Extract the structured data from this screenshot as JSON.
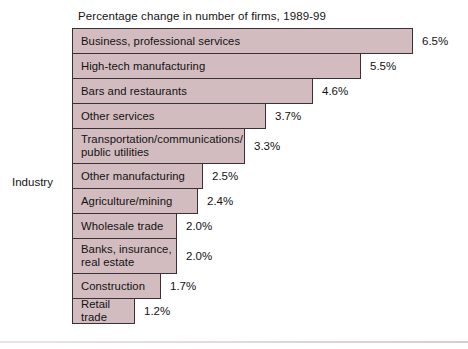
{
  "chart_data": {
    "type": "bar",
    "orientation": "horizontal",
    "title": "Percentage change in number of firms, 1989-99",
    "xlabel": "",
    "ylabel": "Industry",
    "grid": false,
    "legend": null,
    "value_suffix": "%",
    "xlim": [
      0,
      6.5
    ],
    "categories": [
      "Business, professional services",
      "High-tech manufacturing",
      "Bars and restaurants",
      "Other services",
      "Transportation/communications/\npublic utilities",
      "Other manufacturing",
      "Agriculture/mining",
      "Wholesale trade",
      "Banks, insurance,\nreal estate",
      "Construction",
      "Retail trade"
    ],
    "values": [
      6.5,
      5.5,
      4.6,
      3.7,
      3.3,
      2.5,
      2.4,
      2.0,
      2.0,
      1.7,
      1.2
    ],
    "value_labels": [
      "6.5%",
      "5.5%",
      "4.6%",
      "3.7%",
      "3.3%",
      "2.5%",
      "2.4%",
      "2.0%",
      "2.0%",
      "1.7%",
      "1.2%"
    ],
    "bar_fill_color": "#d3bcc0",
    "bar_border_color": "#3a3136",
    "background_color": "#ffffff",
    "text_color": "#121212"
  }
}
